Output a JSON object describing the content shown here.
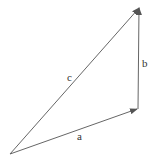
{
  "diagram": {
    "type": "vector-triangle",
    "stroke_color": "#555555",
    "vectors": [
      {
        "label": "a",
        "from": [
          10,
          154
        ],
        "to": [
          137,
          109
        ]
      },
      {
        "label": "b",
        "from": [
          138,
          109
        ],
        "to": [
          139,
          8
        ]
      },
      {
        "label": "c",
        "from": [
          10,
          154
        ],
        "to": [
          139,
          8
        ]
      }
    ],
    "labels": {
      "a": "a",
      "b": "b",
      "c": "c"
    }
  }
}
